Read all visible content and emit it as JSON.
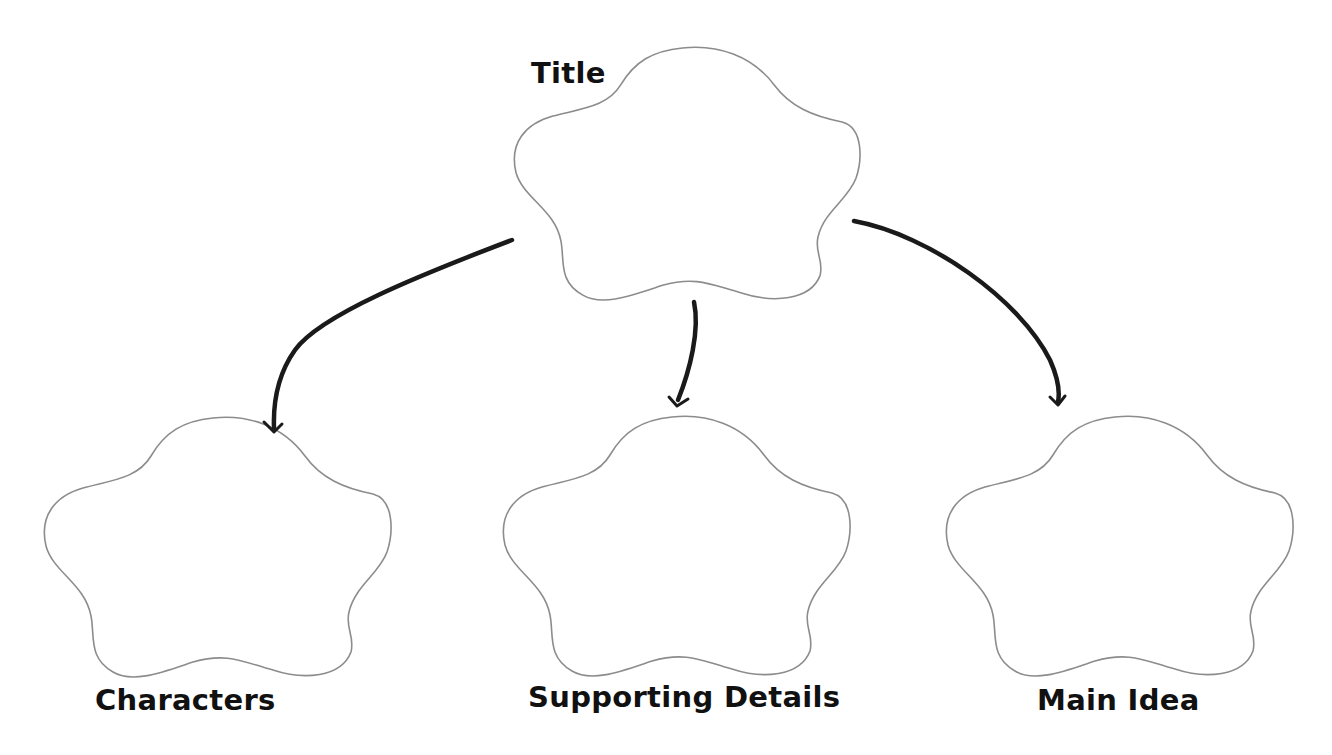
{
  "diagram": {
    "type": "graphic-organizer",
    "colors": {
      "background": "#ffffff",
      "cloud_outline": "#8c8c8c",
      "arrow": "#1a1a1a",
      "text": "#111111"
    },
    "nodes": [
      {
        "id": "title",
        "label": "Title",
        "shape": "cloud",
        "position": "top-center"
      },
      {
        "id": "characters",
        "label": "Characters",
        "shape": "cloud",
        "position": "bottom-left"
      },
      {
        "id": "supporting-details",
        "label": "Supporting Details",
        "shape": "cloud",
        "position": "bottom-center"
      },
      {
        "id": "main-idea",
        "label": "Main Idea",
        "shape": "cloud",
        "position": "bottom-right"
      }
    ],
    "edges": [
      {
        "from": "title",
        "to": "characters"
      },
      {
        "from": "title",
        "to": "supporting-details"
      },
      {
        "from": "title",
        "to": "main-idea"
      }
    ]
  }
}
